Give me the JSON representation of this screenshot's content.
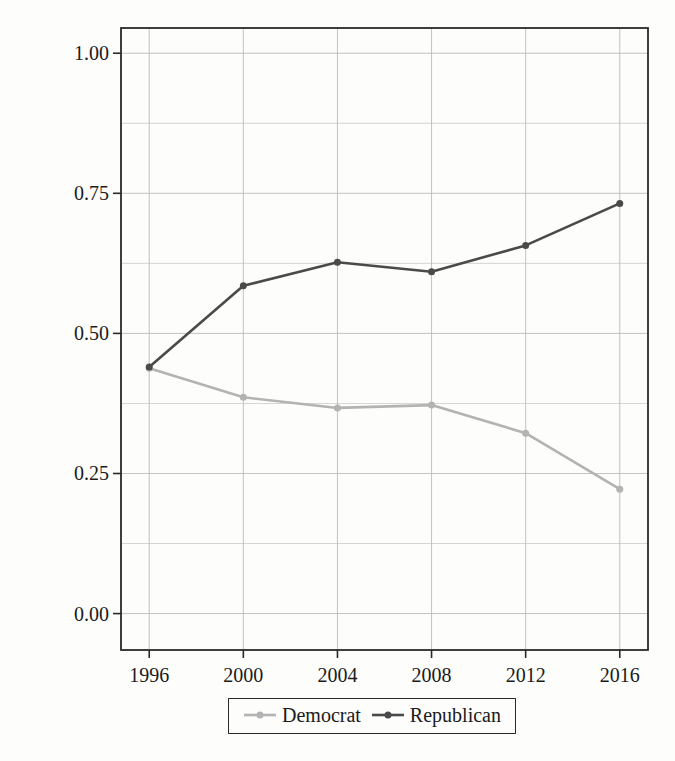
{
  "figure": {
    "background_color": "#fdfdfc",
    "axis_color": "#2a2a2a",
    "grid_color": "#b9b9b9",
    "text_color": "#1a1a1a"
  },
  "chart_data": {
    "type": "line",
    "title": "",
    "xlabel": "",
    "ylabel": "Avg. Presidential Vote (County)",
    "x": [
      1996,
      2000,
      2004,
      2008,
      2012,
      2016
    ],
    "categories": [
      "1996",
      "2000",
      "2004",
      "2008",
      "2012",
      "2016"
    ],
    "xtick_labels": [
      "1996",
      "2000",
      "2004",
      "2008",
      "2012",
      "2016"
    ],
    "ytick_labels": [
      "0.00",
      "0.25",
      "0.50",
      "0.75",
      "1.00"
    ],
    "ytick_values": [
      0.0,
      0.25,
      0.5,
      0.75,
      1.0
    ],
    "ylim": [
      -0.065,
      1.045
    ],
    "xlim": [
      1994.8,
      2017.2
    ],
    "grid": true,
    "grid_minor_y_step": 0.125,
    "legend_position": "bottom-center",
    "series": [
      {
        "name": "Democrat",
        "color": "#b3b3b3",
        "marker": "circle",
        "values": [
          0.438,
          0.386,
          0.367,
          0.372,
          0.322,
          0.222
        ]
      },
      {
        "name": "Republican",
        "color": "#4a4a4a",
        "marker": "circle",
        "values": [
          0.44,
          0.585,
          0.627,
          0.61,
          0.657,
          0.732
        ]
      }
    ]
  },
  "legend": {
    "entries": [
      {
        "label": "Democrat",
        "color": "#b3b3b3"
      },
      {
        "label": "Republican",
        "color": "#4a4a4a"
      }
    ]
  }
}
